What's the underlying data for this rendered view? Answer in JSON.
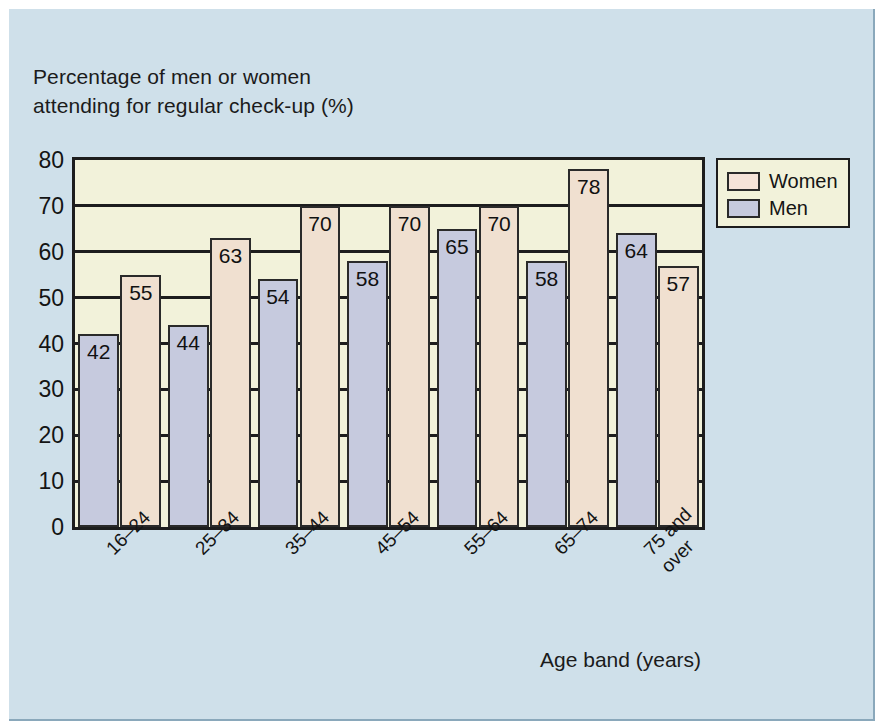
{
  "chart_data": {
    "type": "bar",
    "title": "",
    "ylabel_lines": [
      "Percentage of men or women",
      "attending for regular check-up (%)"
    ],
    "xlabel": "Age band (years)",
    "categories": [
      "16–24",
      "25–34",
      "35–44",
      "45–54",
      "55–64",
      "65–74",
      "75 and over"
    ],
    "series": [
      {
        "name": "Men",
        "values": [
          42,
          44,
          54,
          58,
          65,
          58,
          64
        ]
      },
      {
        "name": "Women",
        "values": [
          55,
          63,
          70,
          70,
          70,
          78,
          57
        ]
      }
    ],
    "ylim": [
      0,
      80
    ],
    "yticks": [
      0,
      10,
      20,
      30,
      40,
      50,
      60,
      70,
      80
    ],
    "ytick_labels": [
      "0",
      "10",
      "20",
      "30",
      "40",
      "50",
      "60",
      "70",
      "80"
    ],
    "grid": true,
    "legend_position": "outside-right-top",
    "colors": {
      "women": "#f0e0d0",
      "men": "#c6cade",
      "plot_background": "#f2f2da",
      "figure_background": "#cfe0ea",
      "axis": "#1d1d1d"
    }
  },
  "axes": {
    "y_title_line1": "Percentage of men or women",
    "y_title_line2": "attending for regular check-up (%)",
    "x_title": "Age band (years)"
  },
  "legend": {
    "items": [
      {
        "label": "Women",
        "swatch": "women"
      },
      {
        "label": "Men",
        "swatch": "men"
      }
    ]
  }
}
